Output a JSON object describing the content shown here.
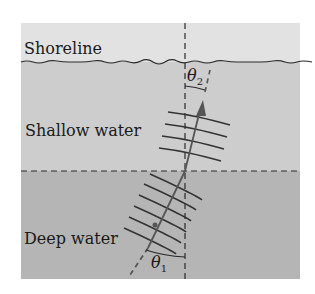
{
  "diagram": {
    "type": "wave-refraction",
    "regions": [
      {
        "id": "shoreline",
        "label": "Shoreline",
        "color": "#e2e2e2"
      },
      {
        "id": "shallow",
        "label": "Shallow water",
        "color": "#cdcdcd"
      },
      {
        "id": "deep",
        "label": "Deep water",
        "color": "#b5b5b5"
      }
    ],
    "angles": [
      {
        "id": "theta2",
        "symbol": "θ",
        "subscript": "2"
      },
      {
        "id": "theta1",
        "symbol": "θ",
        "subscript": "1"
      }
    ],
    "colors": {
      "ink": "#2a2a2a",
      "ray": "#555555"
    }
  }
}
